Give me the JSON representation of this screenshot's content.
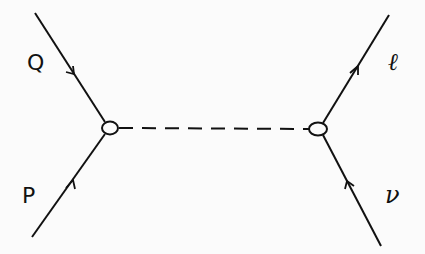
{
  "diagram": {
    "type": "feynman-diagram",
    "vertices": [
      {
        "id": "left-vertex",
        "x": 110,
        "y": 128
      },
      {
        "id": "right-vertex",
        "x": 318,
        "y": 129
      }
    ],
    "lines": [
      {
        "id": "incoming-P",
        "label": "P",
        "style": "solid",
        "arrow": "toward-vertex"
      },
      {
        "id": "outgoing-Q",
        "label": "Q",
        "style": "solid",
        "arrow": "away-from-vertex"
      },
      {
        "id": "propagator",
        "label": "",
        "style": "dashed"
      },
      {
        "id": "outgoing-l",
        "label": "ℓ",
        "style": "solid",
        "arrow": "away-from-vertex"
      },
      {
        "id": "incoming-nu",
        "label": "ν",
        "style": "solid",
        "arrow": "toward-vertex"
      }
    ],
    "labels": {
      "Q": "Q",
      "P": "P",
      "l": "ℓ",
      "nu": "ν"
    },
    "colors": {
      "ink": "#111111",
      "background": "#fbfbfb"
    }
  }
}
